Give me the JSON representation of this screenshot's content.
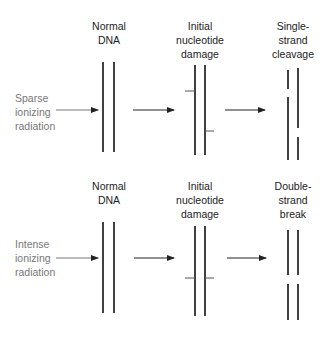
{
  "panels": [
    {
      "id": "sparse",
      "radiation_label": "Sparse\nionizing\nradiation",
      "stages": [
        {
          "label": "Normal\nDNA"
        },
        {
          "label": "Initial\nnucleotide\ndamage"
        },
        {
          "label": "Single-\nstrand\ncleavage"
        }
      ]
    },
    {
      "id": "intense",
      "radiation_label": "Intense\nionizing\nradiation",
      "stages": [
        {
          "label": "Normal\nDNA"
        },
        {
          "label": "Initial\nnucleotide\ndamage"
        },
        {
          "label": "Double-\nstrand\nbreak"
        }
      ]
    }
  ],
  "colors": {
    "strand": "#111111",
    "tick": "#555555",
    "arrow": "#222222",
    "side_text": "#777777"
  }
}
